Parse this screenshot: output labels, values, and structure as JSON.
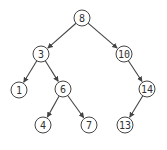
{
  "diagram": {
    "type": "binary-search-tree",
    "colors": {
      "stroke": "#444444",
      "text": "#333333",
      "fill": "#ffffff"
    },
    "nodes": [
      {
        "id": "n8",
        "label": "8",
        "x": 82,
        "y": 18
      },
      {
        "id": "n3",
        "label": "3",
        "x": 41,
        "y": 54
      },
      {
        "id": "n10",
        "label": "10",
        "x": 124,
        "y": 54
      },
      {
        "id": "n1",
        "label": "1",
        "x": 19,
        "y": 90
      },
      {
        "id": "n6",
        "label": "6",
        "x": 63,
        "y": 89
      },
      {
        "id": "n14",
        "label": "14",
        "x": 147,
        "y": 89
      },
      {
        "id": "n4",
        "label": "4",
        "x": 43,
        "y": 125
      },
      {
        "id": "n7",
        "label": "7",
        "x": 89,
        "y": 125
      },
      {
        "id": "n13",
        "label": "13",
        "x": 125,
        "y": 125
      }
    ],
    "edges": [
      {
        "from": "n8",
        "to": "n3"
      },
      {
        "from": "n8",
        "to": "n10"
      },
      {
        "from": "n3",
        "to": "n1"
      },
      {
        "from": "n3",
        "to": "n6"
      },
      {
        "from": "n10",
        "to": "n14"
      },
      {
        "from": "n6",
        "to": "n4"
      },
      {
        "from": "n6",
        "to": "n7"
      },
      {
        "from": "n14",
        "to": "n13"
      }
    ]
  }
}
